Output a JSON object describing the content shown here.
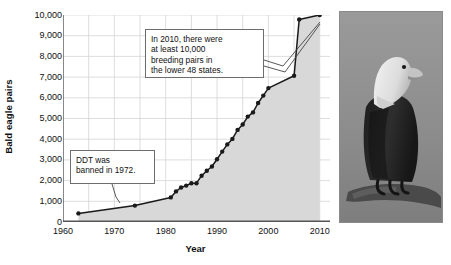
{
  "chart_data": {
    "type": "line",
    "title": "",
    "xlabel": "Year",
    "ylabel": "Bald eagle pairs",
    "xlim": [
      1960,
      2012
    ],
    "ylim": [
      0,
      10000
    ],
    "xticks": [
      1960,
      1970,
      1980,
      1990,
      2000,
      2010
    ],
    "xtick_labels": [
      "1960",
      "1970",
      "1980",
      "1990",
      "2000",
      "2010"
    ],
    "yticks": [
      0,
      1000,
      2000,
      3000,
      4000,
      5000,
      6000,
      7000,
      8000,
      9000,
      10000
    ],
    "ytick_labels": [
      "0",
      "1,000",
      "2,000",
      "3,000",
      "4,000",
      "5,000",
      "6,000",
      "7,000",
      "8,000",
      "9,000",
      "10,000"
    ],
    "grid": true,
    "grid_x_step": 5,
    "legend": "none",
    "area_fill": true,
    "markers": true,
    "series": [
      {
        "name": "Bald eagle breeding pairs in the lower 48 states",
        "x": [
          1963,
          1974,
          1981,
          1982,
          1983,
          1984,
          1985,
          1986,
          1987,
          1988,
          1989,
          1990,
          1991,
          1992,
          1993,
          1994,
          1995,
          1996,
          1997,
          1998,
          1999,
          2000,
          2005,
          2006,
          2010
        ],
        "values": [
          417,
          791,
          1188,
          1480,
          1669,
          1757,
          1875,
          1875,
          2238,
          2475,
          2680,
          3035,
          3399,
          3749,
          4015,
          4449,
          4712,
          5094,
          5295,
          5748,
          6104,
          6471,
          7066,
          9789,
          10000
        ]
      }
    ],
    "annotations": [
      {
        "name": "ddt-callout",
        "text": "DDT was banned in 1972.",
        "lines": [
          "DDT was",
          "banned in 1972."
        ],
        "points_to_year": 1972
      },
      {
        "name": "recovery-callout",
        "text": "In 2010, there were at least 10,000 breeding pairs in the lower 48 states.",
        "lines": [
          "In 2010, there were",
          "at least 10,000",
          "breeding pairs in",
          "the lower 48 states."
        ],
        "points_to_year": 2010
      }
    ],
    "colors": {
      "line": "#1a1a1a",
      "marker": "#1a1a1a",
      "area_fill": "#d8d8d8",
      "grid": "#d4d4d4",
      "axis": "#555555",
      "text": "#111111"
    }
  },
  "photo": {
    "alt_name": "bald-eagle-photo",
    "subject": "Bald eagle perched on a branch",
    "background_color": "#8c8c8c",
    "body_color": "#2a2a2a",
    "head_color": "#ebebeb",
    "beak_color": "#bdbdbd"
  }
}
